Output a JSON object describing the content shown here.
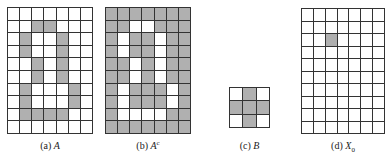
{
  "figure": {
    "fill_color": "#b0b0b0",
    "line_color": "#333333",
    "panels": [
      {
        "id": "a",
        "caption_prefix": "(a) ",
        "caption_var": "A",
        "caption_sup": "",
        "caption_sub": "",
        "rows": 10,
        "cols": 7,
        "left": 7,
        "top": 7,
        "width": 86,
        "height": 127,
        "caption_left": 7,
        "caption_top": 140,
        "caption_width": 86,
        "cells": [
          [
            0,
            0,
            0,
            0,
            0,
            0,
            0
          ],
          [
            0,
            0,
            1,
            1,
            0,
            0,
            0
          ],
          [
            0,
            1,
            0,
            0,
            1,
            0,
            0
          ],
          [
            0,
            1,
            0,
            0,
            1,
            0,
            0
          ],
          [
            0,
            0,
            1,
            0,
            1,
            0,
            0
          ],
          [
            0,
            0,
            1,
            0,
            1,
            0,
            0
          ],
          [
            0,
            1,
            0,
            0,
            0,
            1,
            0
          ],
          [
            0,
            1,
            0,
            0,
            0,
            1,
            0
          ],
          [
            0,
            1,
            1,
            1,
            1,
            0,
            0
          ],
          [
            0,
            0,
            0,
            0,
            0,
            0,
            0
          ]
        ]
      },
      {
        "id": "b",
        "caption_prefix": "(b) ",
        "caption_var": "A",
        "caption_sup": "c",
        "caption_sub": "",
        "rows": 10,
        "cols": 7,
        "left": 105,
        "top": 7,
        "width": 86,
        "height": 127,
        "caption_left": 105,
        "caption_top": 140,
        "caption_width": 86,
        "cells": [
          [
            1,
            1,
            1,
            1,
            1,
            1,
            1
          ],
          [
            1,
            1,
            0,
            0,
            1,
            1,
            1
          ],
          [
            1,
            0,
            1,
            1,
            0,
            1,
            1
          ],
          [
            1,
            0,
            1,
            1,
            0,
            1,
            1
          ],
          [
            1,
            1,
            0,
            1,
            0,
            1,
            1
          ],
          [
            1,
            1,
            0,
            1,
            0,
            1,
            1
          ],
          [
            1,
            0,
            1,
            1,
            1,
            0,
            1
          ],
          [
            1,
            0,
            1,
            1,
            1,
            0,
            1
          ],
          [
            1,
            0,
            0,
            0,
            0,
            1,
            1
          ],
          [
            1,
            1,
            1,
            1,
            1,
            1,
            1
          ]
        ]
      },
      {
        "id": "c",
        "caption_prefix": "(c) ",
        "caption_var": "B",
        "caption_sup": "",
        "caption_sub": "",
        "rows": 3,
        "cols": 3,
        "left": 229,
        "top": 87,
        "width": 41,
        "height": 41,
        "caption_left": 219,
        "caption_top": 140,
        "caption_width": 61,
        "cells": [
          [
            0,
            1,
            0
          ],
          [
            1,
            1,
            1
          ],
          [
            0,
            1,
            0
          ]
        ]
      },
      {
        "id": "d",
        "caption_prefix": "(d) ",
        "caption_var": "X",
        "caption_sup": "",
        "caption_sub": "0",
        "rows": 10,
        "cols": 7,
        "left": 301,
        "top": 8,
        "width": 84,
        "height": 126,
        "caption_left": 301,
        "caption_top": 140,
        "caption_width": 84,
        "cells": [
          [
            0,
            0,
            0,
            0,
            0,
            0,
            0
          ],
          [
            0,
            0,
            0,
            0,
            0,
            0,
            0
          ],
          [
            0,
            0,
            1,
            0,
            0,
            0,
            0
          ],
          [
            0,
            0,
            0,
            0,
            0,
            0,
            0
          ],
          [
            0,
            0,
            0,
            0,
            0,
            0,
            0
          ],
          [
            0,
            0,
            0,
            0,
            0,
            0,
            0
          ],
          [
            0,
            0,
            0,
            0,
            0,
            0,
            0
          ],
          [
            0,
            0,
            0,
            0,
            0,
            0,
            0
          ],
          [
            0,
            0,
            0,
            0,
            0,
            0,
            0
          ],
          [
            0,
            0,
            0,
            0,
            0,
            0,
            0
          ]
        ]
      }
    ]
  }
}
